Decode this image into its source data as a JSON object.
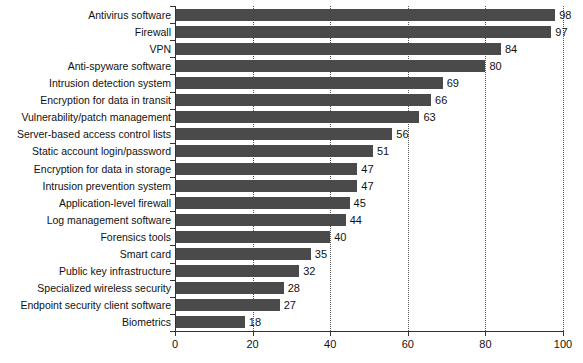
{
  "chart_data": {
    "type": "bar",
    "orientation": "horizontal",
    "title": "",
    "subtitle": "",
    "xlabel": "",
    "ylabel": "",
    "xlim": [
      0,
      100
    ],
    "xticks": [
      0,
      20,
      40,
      60,
      80,
      100
    ],
    "grid": "vertical-dotted",
    "legend": "none",
    "bar_color": "#4a4a4a",
    "axis_color": "#333333",
    "gridline_color": "#555555",
    "background_color": "#ffffff",
    "show_value_labels": true,
    "categories": [
      "Antivirus software",
      "Firewall",
      "VPN",
      "Anti-spyware software",
      "Intrusion detection system",
      "Encryption for data in transit",
      "Vulnerability/patch management",
      "Server-based access control lists",
      "Static account login/password",
      "Encryption for data in storage",
      "Intrusion prevention system",
      "Application-level firewall",
      "Log management software",
      "Forensics tools",
      "Smart card",
      "Public key infrastructure",
      "Specialized wireless security",
      "Endpoint security client software",
      "Biometrics"
    ],
    "values": [
      98,
      97,
      84,
      80,
      69,
      66,
      63,
      56,
      51,
      47,
      47,
      45,
      44,
      40,
      35,
      32,
      28,
      27,
      18
    ],
    "value_labels": [
      "98",
      "97",
      "84",
      "80",
      "69",
      "66",
      "63",
      "56",
      "51",
      "47",
      "47",
      "45",
      "44",
      "40",
      "35",
      "32",
      "28",
      "27",
      "18"
    ],
    "xtick_labels": [
      "0",
      "20",
      "40",
      "60",
      "80",
      "100"
    ]
  }
}
